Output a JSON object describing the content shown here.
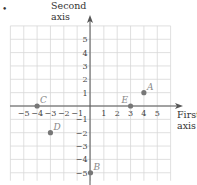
{
  "bullet": "•",
  "axes": {
    "second_axis_line1": "Second",
    "second_axis_line2": "axis",
    "first_axis_line1": "First",
    "first_axis_line2": "axis"
  },
  "x_ticks": [
    "−5",
    "−4",
    "−3",
    "−2",
    "−1",
    "1",
    "2",
    "3",
    "4",
    "5"
  ],
  "y_ticks": [
    "5",
    "4",
    "3",
    "2",
    "1",
    "−1",
    "−2",
    "−3",
    "−4",
    "−5"
  ],
  "points": [
    {
      "label": "A",
      "x": 4,
      "y": 1
    },
    {
      "label": "B",
      "x": 0,
      "y": -5
    },
    {
      "label": "C",
      "x": -4,
      "y": 0
    },
    {
      "label": "D",
      "x": -3,
      "y": -2
    },
    {
      "label": "E",
      "x": 3,
      "y": 0
    }
  ],
  "colors": {
    "grid": "#d8d8d8",
    "axis": "#555555",
    "point": "#777777",
    "point_label": "#999999"
  }
}
